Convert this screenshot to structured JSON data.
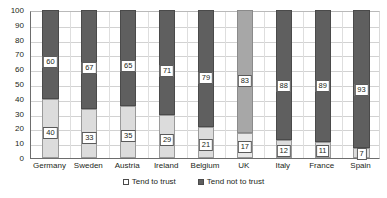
{
  "chart_data": {
    "type": "bar",
    "subtype": "stacked-100-percent",
    "title": "",
    "xlabel": "",
    "ylabel": "",
    "ylim": [
      0,
      100
    ],
    "yticks": [
      0,
      10,
      20,
      30,
      40,
      50,
      60,
      70,
      80,
      90,
      100
    ],
    "grid": true,
    "legend_position": "bottom",
    "categories": [
      "Germany",
      "Sweden",
      "Austria",
      "Ireland",
      "Belgium",
      "UK",
      "Italy",
      "France",
      "Spain"
    ],
    "series": [
      {
        "name": "Tend to trust",
        "color": "#dcdcdc",
        "values": [
          40,
          33,
          35,
          29,
          21,
          17,
          12,
          11,
          7
        ]
      },
      {
        "name": "Tend not to trust",
        "color": "#5f5f5f",
        "values": [
          60,
          67,
          65,
          71,
          79,
          83,
          88,
          89,
          93
        ]
      }
    ],
    "highlighted_category": "UK",
    "highlight_color": "#a7a7a7"
  },
  "legend": {
    "items": [
      {
        "label": "Tend to trust",
        "icon": "legend-swatch-light"
      },
      {
        "label": "Tend not to trust",
        "icon": "legend-swatch-dark"
      }
    ]
  }
}
